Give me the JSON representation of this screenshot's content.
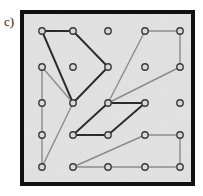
{
  "figure": {
    "label": "c)",
    "type": "geoboard-diagram",
    "board": {
      "frame": {
        "x": 22,
        "y": 12,
        "width": 171,
        "height": 172,
        "border_color": "#111111",
        "border_width": 4,
        "fill_color": "#e3e3e3"
      },
      "grid": {
        "columns": 5,
        "rows": 5,
        "col_x": [
          42,
          73,
          108,
          145,
          180
        ],
        "row_y": [
          31,
          67,
          103,
          135,
          167
        ],
        "peg_radius": 3.2,
        "peg_fill": "#d8d8d8",
        "peg_stroke": "#3a3a3a",
        "peg_stroke_width": 1.4
      },
      "colors": {
        "dark_band": "#2b2b2b",
        "light_band": "#8c8c8c"
      },
      "shapes": [
        {
          "name": "dark-quadrilateral-upper-left",
          "color_key": "dark_band",
          "stroke": "#2b2b2b",
          "stroke_width": 1.9,
          "points": "42,31 73,31 108,67 73,103"
        },
        {
          "name": "dark-parallelogram-center",
          "color_key": "dark_band",
          "stroke": "#2b2b2b",
          "stroke_width": 1.9,
          "points": "108,103 145,103 108,135 73,135"
        },
        {
          "name": "light-triangle-left",
          "color_key": "light_band",
          "stroke": "#8c8c8c",
          "stroke_width": 1.4,
          "points": "42,67 73,103 42,167"
        },
        {
          "name": "light-quadrilateral-upper-right",
          "color_key": "light_band",
          "stroke": "#8c8c8c",
          "stroke_width": 1.4,
          "points": "108,103 145,31 180,31 180,67"
        },
        {
          "name": "light-quadrilateral-bottom-right",
          "color_key": "light_band",
          "stroke": "#8c8c8c",
          "stroke_width": 1.4,
          "points": "73,167 145,135 180,135 180,167"
        }
      ]
    }
  }
}
